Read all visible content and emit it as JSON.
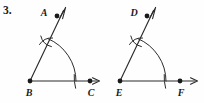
{
  "problem": {
    "number_label": "3."
  },
  "colors": {
    "background": "#fefefe",
    "ink": "#2b2b2b",
    "label_ink": "#1a1a1a"
  },
  "figures": [
    {
      "id": "angle-abc",
      "name": "angle-abc-construction",
      "type": "angle-construction",
      "vertex": "B",
      "rays": [
        "BA",
        "BC"
      ],
      "labels": {
        "ray_end_upper": "A",
        "vertex": "B",
        "ray_end_right": "C"
      },
      "points": {
        "A": {
          "x": 57,
          "y": 16
        },
        "B": {
          "x": 30,
          "y": 81
        },
        "C": {
          "x": 90,
          "y": 81
        }
      },
      "ray_arrow_upper": {
        "tip_x": 65,
        "tip_y": 8
      },
      "ray_arrow_right": {
        "tip_x": 99,
        "tip_y": 81
      },
      "compass_arc": {
        "center": "B",
        "radius": 46,
        "start_angle_deg": 0,
        "end_angle_deg": 67
      },
      "intersection_mark": {
        "x": 46,
        "y": 41,
        "description": "crossing compass arcs on ray BA"
      }
    },
    {
      "id": "angle-def",
      "name": "angle-def-construction",
      "type": "angle-construction",
      "vertex": "E",
      "rays": [
        "ED",
        "EF"
      ],
      "labels": {
        "ray_end_upper": "D",
        "vertex": "E",
        "ray_end_right": "F"
      },
      "points": {
        "D": {
          "x": 147,
          "y": 16
        },
        "E": {
          "x": 120,
          "y": 81
        },
        "F": {
          "x": 180,
          "y": 81
        }
      },
      "ray_arrow_upper": {
        "tip_x": 155,
        "tip_y": 8
      },
      "ray_arrow_right": {
        "tip_x": 197,
        "tip_y": 81
      },
      "compass_arc": {
        "center": "E",
        "radius": 46,
        "start_angle_deg": 0,
        "end_angle_deg": 67
      },
      "intersection_mark": {
        "x": 136,
        "y": 41,
        "description": "crossing compass arcs on ray ED"
      }
    }
  ]
}
